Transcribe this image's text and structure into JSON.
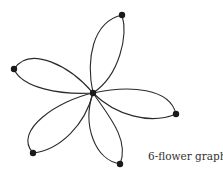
{
  "diagram": {
    "title": "6-flower graph",
    "caption": "6-flower graph",
    "type": "flower graph",
    "center_vertex": {
      "x": 93,
      "y": 93
    },
    "petal_vertices": [
      {
        "name": "top",
        "x": 122,
        "y": 15
      },
      {
        "name": "left",
        "x": 14,
        "y": 69
      },
      {
        "name": "right",
        "x": 176,
        "y": 114
      },
      {
        "name": "bottom-left",
        "x": 33,
        "y": 153
      },
      {
        "name": "bottom",
        "x": 120,
        "y": 164
      }
    ],
    "vertex_count": 6,
    "petal_count": 5,
    "colors": {
      "edge": "#2a2a2a",
      "vertex": "#1a1a1a",
      "background": "#ffffff"
    }
  }
}
